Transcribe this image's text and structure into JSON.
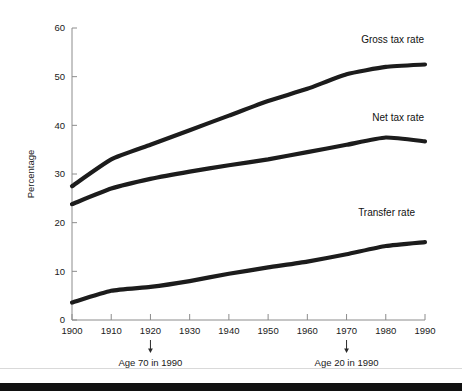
{
  "chart_data": {
    "type": "line",
    "title": "",
    "xlabel": "",
    "ylabel": "Percentage",
    "xlim": [
      1900,
      1990
    ],
    "ylim": [
      0,
      60
    ],
    "grid": false,
    "legend_position": "inline-right",
    "x": [
      1900,
      1910,
      1920,
      1930,
      1940,
      1950,
      1960,
      1970,
      1980,
      1990
    ],
    "xticks": [
      "1900",
      "1910",
      "1920",
      "1930",
      "1940",
      "1950",
      "1960",
      "1970",
      "1980",
      "1990"
    ],
    "yticks": [
      "0",
      "10",
      "20",
      "30",
      "40",
      "50",
      "60"
    ],
    "ytick_values": [
      0,
      10,
      20,
      30,
      40,
      50,
      60
    ],
    "series": [
      {
        "name": "Gross tax rate",
        "label": "Gross tax rate",
        "values": [
          27.5,
          33.0,
          36.0,
          39.0,
          42.0,
          45.0,
          47.5,
          50.5,
          52.0,
          52.5
        ]
      },
      {
        "name": "Net tax rate",
        "label": "Net tax rate",
        "values": [
          23.8,
          27.0,
          29.0,
          30.5,
          31.8,
          33.0,
          34.5,
          36.0,
          37.5,
          36.7
        ]
      },
      {
        "name": "Transfer rate",
        "label": "Transfer rate",
        "values": [
          3.6,
          6.0,
          6.8,
          8.0,
          9.5,
          10.8,
          12.0,
          13.5,
          15.2,
          16.0
        ]
      }
    ],
    "annotations": [
      {
        "text": "Age 70 in 1990",
        "x": 1920,
        "marker": "down-arrow"
      },
      {
        "text": "Age 20 in 1990",
        "x": 1970,
        "marker": "down-arrow"
      }
    ],
    "colors": {
      "line": "#1c1c1c",
      "axis": "#8c8c8c",
      "text": "#1a1a1a",
      "background": "#ffffff",
      "footer_bar": "#111111",
      "footer_rule": "#d9d9d9"
    }
  }
}
